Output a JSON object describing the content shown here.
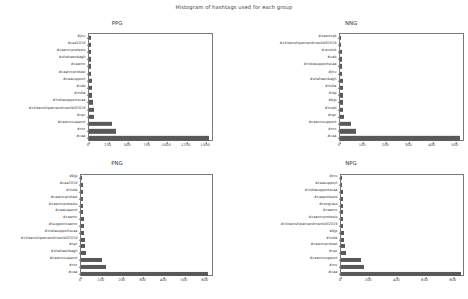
{
  "figure": {
    "suptitle": "Histogram of hashtags used for each group",
    "bar_color": "#595959",
    "axis_color": "#7a7a7a",
    "text_color": "#3c3c3c"
  },
  "chart_data": [
    {
      "type": "bar",
      "orientation": "horizontal",
      "title": "PPG",
      "xlabel": "",
      "ylabel": "",
      "grid": false,
      "legend": "none",
      "xlim": [
        0,
        1600
      ],
      "xticks": [
        0,
        250,
        500,
        750,
        1000,
        1250,
        1500
      ],
      "categories": [
        "#jnu",
        "#caa2019",
        "#caanrcprotests",
        "#shaheenbagh",
        "#caanrc",
        "#caanrcprotest",
        "#caasupport",
        "#cab",
        "#india",
        "#indiasupportscaa",
        "#citizenshipamendmentbill2019",
        "#npr",
        "#caanrcsupport",
        "#nrc",
        "#caa"
      ],
      "values": [
        20,
        22,
        24,
        26,
        28,
        30,
        33,
        36,
        40,
        48,
        58,
        70,
        300,
        340,
        1530
      ]
    },
    {
      "type": "bar",
      "orientation": "horizontal",
      "title": "NNG",
      "xlabel": "",
      "ylabel": "",
      "grid": false,
      "legend": "none",
      "xlim": [
        0,
        540
      ],
      "xticks": [
        0,
        100,
        200,
        300,
        400,
        500
      ],
      "categories": [
        "#caanrcpt",
        "#citizenshipamendmentbill2019",
        "#revolut",
        "#cab",
        "#indiasupportscaa",
        "#jnu",
        "#shaheenbagh",
        "#india",
        "#isp",
        "#bjp",
        "#modi",
        "#npr",
        "#caanrcsupport",
        "#nrc",
        "#caa"
      ],
      "values": [
        5,
        6,
        7,
        8,
        9,
        10,
        11,
        12,
        13,
        14,
        15,
        17,
        48,
        68,
        520
      ]
    },
    {
      "type": "bar",
      "orientation": "horizontal",
      "title": "PNG",
      "xlabel": "",
      "ylabel": "",
      "grid": false,
      "legend": "none",
      "xlim": [
        0,
        640
      ],
      "xticks": [
        0,
        100,
        200,
        300,
        400,
        500,
        600
      ],
      "categories": [
        "#bjp",
        "#caa2019",
        "#india",
        "#caanrcprotest",
        "#caanrcprotests",
        "#caasupport",
        "#caanrc",
        "#isupportcaanrc",
        "#indiasupportscaa",
        "#citizenshipamendmentbill2019",
        "#npr",
        "#shaheenbagh",
        "#caanrcsupport",
        "#nrc",
        "#caa"
      ],
      "values": [
        7,
        8,
        9,
        10,
        11,
        12,
        13,
        14,
        15,
        17,
        18,
        22,
        100,
        120,
        610
      ]
    },
    {
      "type": "bar",
      "orientation": "horizontal",
      "title": "NPG",
      "xlabel": "",
      "ylabel": "",
      "grid": false,
      "legend": "none",
      "xlim": [
        0,
        880
      ],
      "xticks": [
        0,
        200,
        400,
        600,
        800
      ],
      "categories": [
        "#jnu",
        "#caasupport",
        "#indiasupportscaa",
        "#caaprotests",
        "#congress",
        "#caanrc",
        "#caanrcprotests",
        "#citizenshipamendmentbill2019",
        "#bjp",
        "#india",
        "#caanrcprotest",
        "#npr",
        "#caanrcsupport",
        "#nrc",
        "#caa"
      ],
      "values": [
        9,
        10,
        11,
        12,
        13,
        14,
        15,
        16,
        18,
        20,
        26,
        32,
        140,
        165,
        850
      ]
    }
  ]
}
